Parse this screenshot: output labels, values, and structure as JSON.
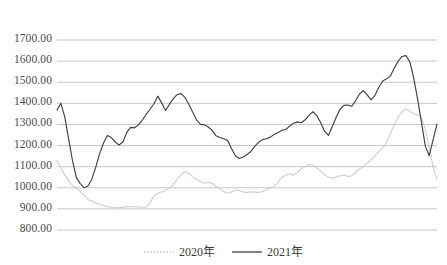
{
  "chart_data": {
    "type": "line",
    "title": "",
    "subtitle": "",
    "xlabel": "",
    "ylabel": "",
    "ylim": [
      800,
      1700
    ],
    "ytick_labels": [
      "1700.00",
      "1600.00",
      "1500.00",
      "1400.00",
      "1300.00",
      "1200.00",
      "1100.00",
      "1000.00",
      "900.00",
      "800.00"
    ],
    "ytick_values": [
      1700,
      1600,
      1500,
      1400,
      1300,
      1200,
      1100,
      1000,
      900,
      800
    ],
    "xtick_labels": [],
    "grid": true,
    "grid_axis": "y",
    "legend_position": "bottom",
    "series": [
      {
        "name": "2020年",
        "style": "dotted",
        "color": "#c9c9c9",
        "values": [
          1128,
          1092,
          1060,
          1032,
          1008,
          996,
          978,
          958,
          942,
          934,
          926,
          920,
          914,
          909,
          906,
          905,
          907,
          909,
          911,
          911,
          910,
          909,
          906,
          922,
          955,
          972,
          979,
          986,
          997,
          1012,
          1040,
          1062,
          1076,
          1068,
          1052,
          1038,
          1028,
          1022,
          1027,
          1018,
          1004,
          992,
          978,
          975,
          983,
          990,
          984,
          977,
          979,
          981,
          978,
          980,
          988,
          998,
          1003,
          1020,
          1046,
          1058,
          1066,
          1060,
          1072,
          1089,
          1101,
          1110,
          1107,
          1094,
          1076,
          1062,
          1049,
          1046,
          1052,
          1058,
          1060,
          1052,
          1062,
          1080,
          1094,
          1106,
          1124,
          1142,
          1160,
          1182,
          1202,
          1240,
          1284,
          1325,
          1356,
          1372,
          1366,
          1352,
          1346,
          1338,
          1282,
          1198,
          1100,
          1040
        ]
      },
      {
        "name": "2021年",
        "style": "solid",
        "color": "#404040",
        "values": [
          1368,
          1400,
          1336,
          1232,
          1128,
          1048,
          1020,
          1000,
          1008,
          1042,
          1098,
          1162,
          1212,
          1248,
          1238,
          1218,
          1202,
          1218,
          1262,
          1286,
          1284,
          1298,
          1320,
          1348,
          1372,
          1398,
          1434,
          1402,
          1366,
          1396,
          1422,
          1442,
          1446,
          1428,
          1396,
          1358,
          1322,
          1300,
          1298,
          1288,
          1272,
          1246,
          1238,
          1232,
          1224,
          1186,
          1152,
          1139,
          1146,
          1158,
          1172,
          1196,
          1216,
          1228,
          1232,
          1240,
          1252,
          1262,
          1272,
          1276,
          1292,
          1306,
          1312,
          1308,
          1322,
          1344,
          1360,
          1342,
          1308,
          1268,
          1248,
          1290,
          1334,
          1372,
          1390,
          1392,
          1386,
          1412,
          1444,
          1460,
          1440,
          1416,
          1438,
          1476,
          1506,
          1516,
          1530,
          1568,
          1600,
          1622,
          1626,
          1596,
          1520,
          1420,
          1310,
          1196,
          1152,
          1228,
          1302
        ]
      }
    ]
  },
  "legend": {
    "items": [
      {
        "label": "2020年",
        "style": "dotted",
        "color": "#c9c9c9"
      },
      {
        "label": "2021年",
        "style": "solid",
        "color": "#404040"
      }
    ]
  },
  "axis": {
    "gridline_color": "#bfbfbf",
    "label_color": "#4a4a4a"
  }
}
